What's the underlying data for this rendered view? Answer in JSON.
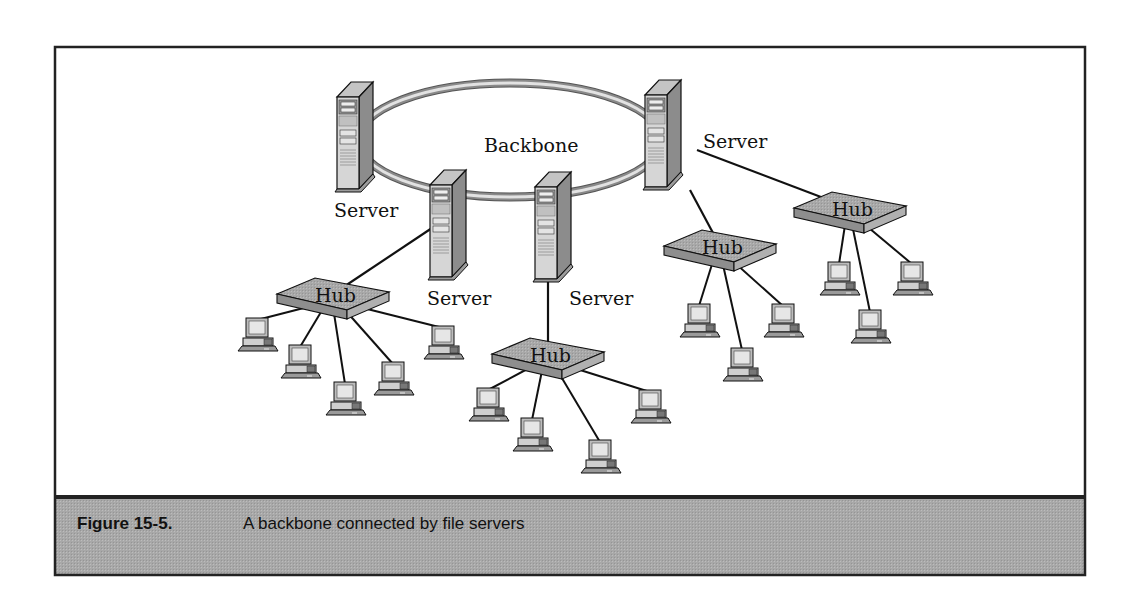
{
  "figure": {
    "frame": {
      "x": 55,
      "y": 47,
      "w": 1030,
      "h": 528,
      "caption_top": 497
    },
    "colors": {
      "frame": "#222222",
      "caption_band": "#a9a9a9",
      "backbone_outer": "#8a8a8a",
      "backbone_inner": "#e2e2e2",
      "device_top": "#bdbdbd",
      "device_front": "#d8d8d8",
      "device_side": "#8f8f8f",
      "link": "#111111"
    },
    "caption": {
      "number": "Figure 15-5.",
      "text": "A backbone connected by file servers"
    },
    "backbone": {
      "label": "Backbone",
      "cx": 510,
      "cy": 140,
      "rx": 152,
      "ry": 57,
      "label_x": 484,
      "label_y": 152
    },
    "servers": [
      {
        "id": "server-1",
        "label": "Server",
        "x": 337,
        "y": 82,
        "label_x": 334,
        "label_y": 217
      },
      {
        "id": "server-2",
        "label": "Server",
        "x": 430,
        "y": 170,
        "label_x": 427,
        "label_y": 305
      },
      {
        "id": "server-3",
        "label": "Server",
        "x": 535,
        "y": 172,
        "label_x": 569,
        "label_y": 305
      },
      {
        "id": "server-4",
        "label": "Server",
        "x": 645,
        "y": 80,
        "label_x": 703,
        "label_y": 148
      }
    ],
    "hubs": [
      {
        "id": "hub-a",
        "label": "Hub",
        "cx": 333,
        "cy": 298,
        "uplink": [
          432,
          228
        ],
        "computers": [
          [
            242,
            318
          ],
          [
            285,
            345
          ],
          [
            330,
            382
          ],
          [
            378,
            362
          ],
          [
            428,
            326
          ]
        ]
      },
      {
        "id": "hub-b",
        "label": "Hub",
        "cx": 548,
        "cy": 358,
        "uplink": [
          548,
          282
        ],
        "computers": [
          [
            473,
            388
          ],
          [
            517,
            418
          ],
          [
            585,
            440
          ],
          [
            635,
            390
          ]
        ]
      },
      {
        "id": "hub-c",
        "label": "Hub",
        "cx": 720,
        "cy": 250,
        "uplink": [
          690,
          190
        ],
        "computers": [
          [
            684,
            304
          ],
          [
            727,
            348
          ],
          [
            768,
            304
          ]
        ]
      },
      {
        "id": "hub-d",
        "label": "Hub",
        "cx": 850,
        "cy": 212,
        "uplink": [
          697,
          150
        ],
        "computers": [
          [
            824,
            262
          ],
          [
            855,
            310
          ],
          [
            897,
            262
          ]
        ]
      }
    ]
  }
}
